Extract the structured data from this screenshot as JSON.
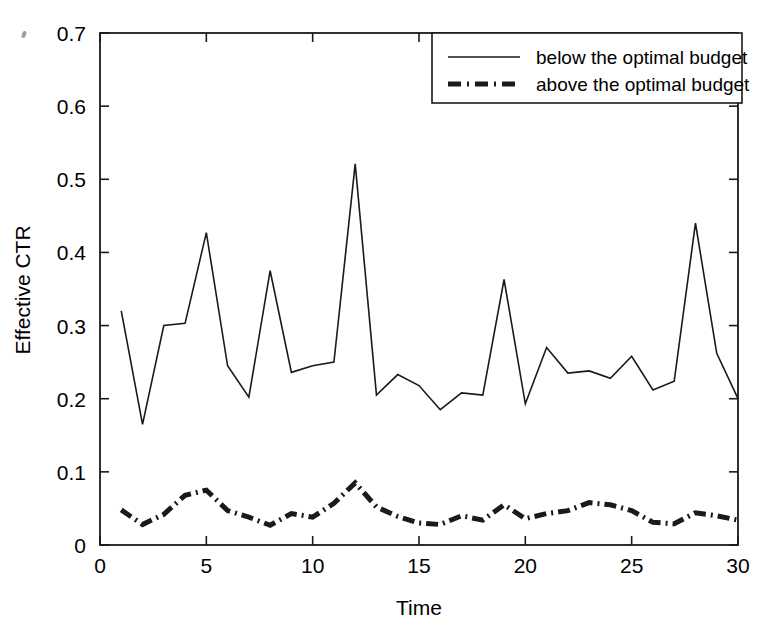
{
  "figure": {
    "background_color": "#ffffff",
    "line_color": "#1a1a1a",
    "frame_color": "#1a1a1a"
  },
  "axes": {
    "x_title": "Time",
    "y_title": "Effective CTR",
    "x_ticks": [
      "0",
      "5",
      "10",
      "15",
      "20",
      "25",
      "30"
    ],
    "y_ticks": [
      "0",
      "0.1",
      "0.2",
      "0.3",
      "0.4",
      "0.5",
      "0.6",
      "0.7"
    ]
  },
  "legend": {
    "items": [
      {
        "label": "below the optimal budget",
        "style": "solid"
      },
      {
        "label": "above the optimal budget",
        "style": "dash-dot"
      }
    ]
  },
  "chart_data": {
    "type": "line",
    "title": "",
    "xlabel": "Time",
    "ylabel": "Effective CTR",
    "xlim": [
      0,
      30
    ],
    "ylim": [
      0,
      0.7
    ],
    "xticks": [
      0,
      5,
      10,
      15,
      20,
      25,
      30
    ],
    "yticks": [
      0,
      0.1,
      0.2,
      0.3,
      0.4,
      0.5,
      0.6,
      0.7
    ],
    "grid": false,
    "legend_position": "upper right",
    "x": [
      1,
      2,
      3,
      4,
      5,
      6,
      7,
      8,
      9,
      10,
      11,
      12,
      13,
      14,
      15,
      16,
      17,
      18,
      19,
      20,
      21,
      22,
      23,
      24,
      25,
      26,
      27,
      28,
      29,
      30
    ],
    "series": [
      {
        "name": "below the optimal budget",
        "style": "solid",
        "values": [
          0.32,
          0.165,
          0.3,
          0.303,
          0.427,
          0.245,
          0.202,
          0.375,
          0.236,
          0.245,
          0.25,
          0.521,
          0.205,
          0.233,
          0.218,
          0.185,
          0.208,
          0.205,
          0.363,
          0.193,
          0.27,
          0.235,
          0.238,
          0.228,
          0.258,
          0.212,
          0.224,
          0.44,
          0.262,
          0.2
        ]
      },
      {
        "name": "above the optimal budget",
        "style": "dash-dot",
        "values": [
          0.048,
          0.028,
          0.042,
          0.068,
          0.075,
          0.047,
          0.038,
          0.027,
          0.043,
          0.038,
          0.057,
          0.085,
          0.052,
          0.039,
          0.03,
          0.028,
          0.04,
          0.034,
          0.055,
          0.036,
          0.043,
          0.047,
          0.058,
          0.055,
          0.047,
          0.031,
          0.029,
          0.044,
          0.04,
          0.034
        ]
      }
    ]
  }
}
